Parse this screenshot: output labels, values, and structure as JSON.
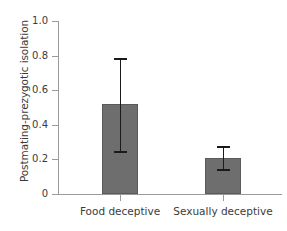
{
  "chart_data": {
    "type": "bar",
    "title": "",
    "xlabel": "",
    "ylabel": "Postmating-prezygotic isolation",
    "categories": [
      "Food deceptive",
      "Sexually deceptive"
    ],
    "values": [
      0.52,
      0.21
    ],
    "errors_upper": [
      0.78,
      0.27
    ],
    "errors_lower": [
      0.24,
      0.14
    ],
    "ylim": [
      0,
      1.0
    ],
    "yticks": [
      0,
      0.2,
      0.4,
      0.6,
      0.8,
      1.0
    ],
    "ytick_labels": [
      "0",
      "0.2",
      "0.4",
      "0.6",
      "0.8",
      "1.0"
    ],
    "grid": false,
    "legend": "none",
    "bar_color": "#6e6e6e",
    "error_color": "#1a1a1a",
    "axis_color": "#9a9a9a",
    "text_color": "#3b3b3b"
  }
}
